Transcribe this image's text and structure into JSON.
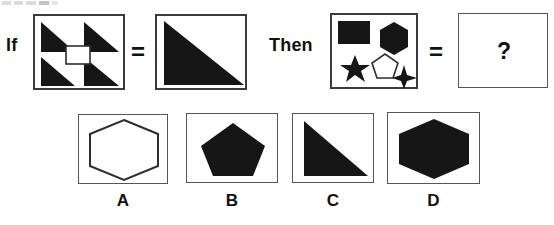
{
  "puzzle": {
    "type": "visual-analogy-multiple-choice",
    "connectors": {
      "if_label": "If",
      "then_label": "Then",
      "equals_1": "=",
      "equals_2": "=",
      "answer_placeholder": "?"
    },
    "premise": {
      "source_panel": {
        "name": "four-triangles-with-square",
        "shapes": [
          {
            "id": "triangle-top-left",
            "shape": "right-triangle",
            "fill": "black",
            "orientation": "right-angle-bottom-left"
          },
          {
            "id": "triangle-top-right",
            "shape": "right-triangle",
            "fill": "black",
            "orientation": "right-angle-bottom-left"
          },
          {
            "id": "triangle-bottom-left",
            "shape": "right-triangle",
            "fill": "black",
            "orientation": "right-angle-bottom-left"
          },
          {
            "id": "triangle-bottom-right",
            "shape": "right-triangle",
            "fill": "black",
            "orientation": "right-angle-bottom-left"
          },
          {
            "id": "square-center",
            "shape": "square",
            "fill": "white",
            "stroke": "black"
          }
        ]
      },
      "result_panel": {
        "name": "large-black-triangle",
        "shapes": [
          {
            "id": "triangle-large",
            "shape": "right-triangle",
            "fill": "black",
            "orientation": "right-angle-bottom-left"
          }
        ]
      }
    },
    "query": {
      "source_panel": {
        "name": "mixed-shapes",
        "shapes": [
          {
            "id": "rectangle",
            "shape": "rectangle",
            "fill": "black"
          },
          {
            "id": "hexagon",
            "shape": "hexagon",
            "fill": "black"
          },
          {
            "id": "six-point-star",
            "shape": "six-pointed-star",
            "fill": "black"
          },
          {
            "id": "pentagon",
            "shape": "pentagon",
            "fill": "white",
            "stroke": "black"
          },
          {
            "id": "four-point-sparkle",
            "shape": "four-pointed-star",
            "fill": "black"
          }
        ]
      },
      "result_panel": {
        "name": "unknown-answer",
        "content": "?"
      }
    },
    "options": [
      {
        "letter": "A",
        "name": "hexagon-outline",
        "shape": "hexagon",
        "fill": "white",
        "stroke": "black"
      },
      {
        "letter": "B",
        "name": "pentagon-filled",
        "shape": "pentagon",
        "fill": "black",
        "stroke": "black"
      },
      {
        "letter": "C",
        "name": "triangle-filled",
        "shape": "right-triangle",
        "fill": "black",
        "stroke": "black"
      },
      {
        "letter": "D",
        "name": "hexagon-filled",
        "shape": "hexagon",
        "fill": "black",
        "stroke": "black"
      }
    ]
  },
  "colors": {
    "ink": "#111111",
    "shape_fill": "#161616",
    "shape_stroke": "#2e2e2e",
    "panel_border": "#3b3b3b",
    "background": "#ffffff"
  }
}
